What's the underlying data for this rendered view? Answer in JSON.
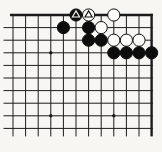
{
  "diagram": {
    "type": "go-board-corner-diagram",
    "background_color": "#f7f6f3",
    "line_color": "#1b1b1b",
    "black_stone_color": "#0d0d0d",
    "white_stone_color": "#fcfcfa",
    "board": {
      "grid": {
        "cols": 12,
        "rows": 10,
        "x0": 13,
        "y0": 15,
        "spacing": 12.6,
        "thick_top_edge": true,
        "thick_right_edge": true,
        "cut_left": true,
        "cut_bottom": true,
        "left_overhang": 9.5,
        "bottom_overhang": 8,
        "thin_line_width": 1,
        "edge_line_width": 2.4,
        "stone_radius": 6.1,
        "star_radius": 1.7
      },
      "star_points": [
        {
          "col": 4,
          "row": 4
        },
        {
          "col": 4,
          "row": 9
        },
        {
          "col": 9,
          "row": 9
        }
      ],
      "stones": [
        {
          "col": 6,
          "row": 1,
          "color": "black",
          "mark": "triangle"
        },
        {
          "col": 7,
          "row": 1,
          "color": "white",
          "mark": "triangle"
        },
        {
          "col": 9,
          "row": 1,
          "color": "white",
          "mark": null
        },
        {
          "col": 5,
          "row": 2,
          "color": "black",
          "mark": null
        },
        {
          "col": 7,
          "row": 2,
          "color": "black",
          "mark": null
        },
        {
          "col": 8,
          "row": 2,
          "color": "white",
          "mark": null
        },
        {
          "col": 7,
          "row": 3,
          "color": "black",
          "mark": null
        },
        {
          "col": 8,
          "row": 3,
          "color": "black",
          "mark": null
        },
        {
          "col": 9,
          "row": 3,
          "color": "white",
          "mark": null
        },
        {
          "col": 10,
          "row": 3,
          "color": "white",
          "mark": null
        },
        {
          "col": 11,
          "row": 3,
          "color": "white",
          "mark": null
        },
        {
          "col": 9,
          "row": 4,
          "color": "black",
          "mark": null
        },
        {
          "col": 10,
          "row": 4,
          "color": "black",
          "mark": null
        },
        {
          "col": 11,
          "row": 4,
          "color": "black",
          "mark": null
        },
        {
          "col": 12,
          "row": 4,
          "color": "black",
          "mark": null
        }
      ]
    }
  }
}
